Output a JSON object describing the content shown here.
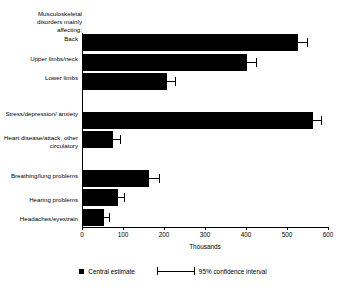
{
  "chart_data": {
    "type": "bar",
    "orientation": "horizontal",
    "title": "",
    "xlabel": "Thousands",
    "ylabel": "",
    "xlim": [
      0,
      600
    ],
    "xticks": [
      0,
      100,
      200,
      300,
      400,
      500,
      600
    ],
    "grid": false,
    "group_heading": "Musculoskeletal disorders mainly affecting:",
    "categories": [
      "Back",
      "Upper limbs/neck",
      "Lower limbs",
      "",
      "Stress/depression/ anxiety",
      "Heart disease/attack, other circulatory",
      "",
      "Breathing/lung problems",
      "Hearing problems",
      "Headaches/eyestrain"
    ],
    "series": [
      {
        "name": "Central estimate",
        "values": [
          527,
          402,
          207,
          null,
          563,
          76,
          null,
          163,
          88,
          54
        ]
      }
    ],
    "error_bars": {
      "name": "95% confidence interval",
      "low": [
        503,
        378,
        186,
        null,
        541,
        58,
        null,
        140,
        72,
        41
      ],
      "high": [
        551,
        427,
        229,
        null,
        585,
        95,
        null,
        190,
        105,
        68
      ]
    },
    "legend": {
      "position": "bottom",
      "entries": [
        {
          "label": "Central estimate",
          "marker": "square-swatch",
          "color": "#000000"
        },
        {
          "label": "95% confidence interval",
          "marker": "error-bar",
          "color": "#000000"
        }
      ]
    },
    "colors": {
      "bar": "#000000",
      "axis": "#000000",
      "background": "#ffffff"
    }
  }
}
